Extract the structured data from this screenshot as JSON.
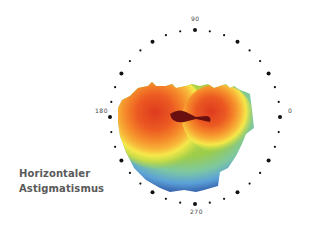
{
  "caption": {
    "line1": "Horizontaler",
    "line2": "Astigmatismus"
  },
  "polar_ring": {
    "labels": {
      "top": "90",
      "left": "180",
      "right": "0",
      "bottom": "270"
    },
    "tick_step_deg": 10,
    "major_tick_step_deg": 30,
    "dot_color": "#111111"
  },
  "map": {
    "type": "wavefront-heatmap",
    "pattern": "horizontal-astigmatism",
    "colors": [
      "#0d1a5c",
      "#2b4f9e",
      "#5aa0d8",
      "#7ec8a0",
      "#9ccc4a",
      "#d8e040",
      "#f5e84a",
      "#f8b83a",
      "#f58a2a",
      "#ec5a22",
      "#dd3a1e",
      "#6a1010"
    ]
  }
}
